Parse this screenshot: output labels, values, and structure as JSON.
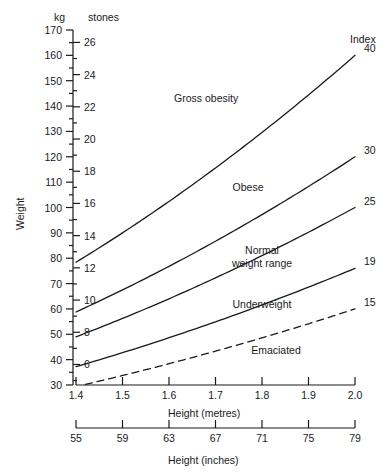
{
  "chart_data": {
    "type": "line",
    "title": "",
    "xlabel": "Height (metres)",
    "ylabel": "Weight",
    "xlim": [
      1.4,
      2.0
    ],
    "ylim": [
      30,
      170
    ],
    "grid": false,
    "legend_position": "right-inline",
    "axes": {
      "y_primary": {
        "unit": "kg",
        "label": "kg",
        "ticks": [
          30,
          40,
          50,
          60,
          70,
          80,
          90,
          100,
          110,
          120,
          130,
          140,
          150,
          160,
          170
        ],
        "minor_step": 5
      },
      "y_secondary": {
        "unit": "stones",
        "label": "stones",
        "ticks": [
          6,
          8,
          10,
          12,
          14,
          16,
          18,
          20,
          22,
          24,
          26
        ],
        "kg_per_stone": 6.35029,
        "minor_step": 1
      },
      "x_primary": {
        "unit": "metres",
        "label": "Height (metres)",
        "ticks": [
          1.4,
          1.5,
          1.6,
          1.7,
          1.8,
          1.9,
          2.0
        ],
        "tick_labels": [
          "1.4",
          "1.5",
          "1.6",
          "1.7",
          "1.8",
          "1.9",
          "2.0"
        ]
      },
      "x_secondary": {
        "unit": "inches",
        "label": "Height (inches)",
        "ticks": [
          55,
          59,
          63,
          67,
          71,
          75,
          79
        ],
        "tick_labels": [
          "55",
          "59",
          "63",
          "67",
          "71",
          "75",
          "79"
        ]
      }
    },
    "index_header": "Index",
    "series": [
      {
        "name": "40",
        "bmi": 40,
        "style": "solid",
        "label": "40",
        "x": [
          1.4,
          1.5,
          1.6,
          1.7,
          1.8,
          1.9,
          2.0
        ],
        "values": [
          78.4,
          90.0,
          102.4,
          115.6,
          129.6,
          144.4,
          160.0
        ]
      },
      {
        "name": "30",
        "bmi": 30,
        "style": "solid",
        "label": "30",
        "x": [
          1.4,
          1.5,
          1.6,
          1.7,
          1.8,
          1.9,
          2.0
        ],
        "values": [
          58.8,
          67.5,
          76.8,
          86.7,
          97.2,
          108.3,
          120.0
        ]
      },
      {
        "name": "25",
        "bmi": 25,
        "style": "solid",
        "label": "25",
        "x": [
          1.4,
          1.5,
          1.6,
          1.7,
          1.8,
          1.9,
          2.0
        ],
        "values": [
          49.0,
          56.3,
          64.0,
          72.3,
          81.0,
          90.3,
          100.0
        ]
      },
      {
        "name": "19",
        "bmi": 19,
        "style": "solid",
        "label": "19",
        "x": [
          1.4,
          1.5,
          1.6,
          1.7,
          1.8,
          1.9,
          2.0
        ],
        "values": [
          37.2,
          42.8,
          48.6,
          54.9,
          61.6,
          68.6,
          76.0
        ]
      },
      {
        "name": "15",
        "bmi": 15,
        "style": "dashed",
        "label": "15",
        "x": [
          1.4,
          1.5,
          1.6,
          1.7,
          1.8,
          1.9,
          2.0
        ],
        "values": [
          29.4,
          33.8,
          38.4,
          43.4,
          48.6,
          54.2,
          60.0
        ]
      }
    ],
    "annotations": [
      {
        "text": "Gross obesity",
        "x": 1.68,
        "y": 143
      },
      {
        "text": "Obese",
        "x": 1.77,
        "y": 108
      },
      {
        "text": "Normal weight range",
        "x": 1.8,
        "y": 80
      },
      {
        "text": "Underweight",
        "x": 1.8,
        "y": 62
      },
      {
        "text": "Emaciated",
        "x": 1.83,
        "y": 44
      }
    ]
  },
  "colors": {
    "line": "#1a1a1a",
    "axis": "#1a1a1a",
    "text": "#1a1a1a",
    "background": "#ffffff"
  }
}
